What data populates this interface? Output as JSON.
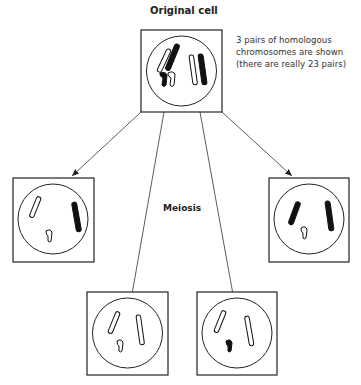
{
  "diagram": {
    "title": "Original cell",
    "note_lines": [
      "3 pairs of homologous",
      "chromosomes are shown",
      "(there are really 23 pairs)"
    ],
    "process_label": "Meiosis",
    "cells": [
      {
        "id": "original",
        "label": "Original cell",
        "chromosomes": "6 (3 homologous pairs: long white + long black, medium white + medium black, short white hook + short black hook)"
      },
      {
        "id": "gamete-1",
        "position": "middle-left",
        "chromosomes": "long white, long black, short white hook"
      },
      {
        "id": "gamete-2",
        "position": "bottom-left",
        "chromosomes": "long white, long white, short white hook"
      },
      {
        "id": "gamete-3",
        "position": "bottom-right",
        "chromosomes": "long white, long white, short black hook"
      },
      {
        "id": "gamete-4",
        "position": "middle-right",
        "chromosomes": "long black, long black, short white hook"
      }
    ],
    "colors": {
      "line": "#222222",
      "chromosome_fill_dark": "#111111",
      "chromosome_fill_light": "#ffffff"
    }
  }
}
